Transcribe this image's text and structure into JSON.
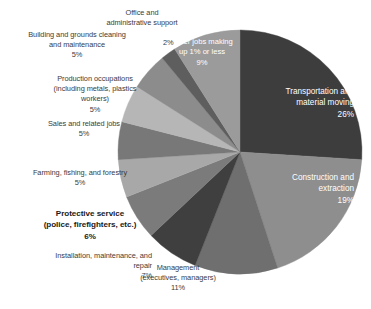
{
  "chart_data": {
    "type": "pie",
    "title": "",
    "subtitle": "",
    "xlabel": "",
    "ylabel": "",
    "legend_position": "none",
    "grid": false,
    "units": "percent",
    "start_angle_deg": 0,
    "direction": "clockwise",
    "categories": [
      "Transportation and material moving",
      "Construction and extraction",
      "Management (executives, managers)",
      "Installation, maintenance, and repair",
      "Protective service (police, firefighters, etc.)",
      "Farming, fishing, and forestry",
      "Sales and related jobs",
      "Production occupations (including metals, plastics workers)",
      "Building and grounds cleaning and maintenance",
      "Office and administrative support",
      "Other jobs making up 1% or less"
    ],
    "values": [
      26,
      19,
      11,
      7,
      6,
      5,
      5,
      5,
      5,
      2,
      9
    ],
    "colors": [
      "#3d3d3d",
      "#8e8e8e",
      "#6f6f6f",
      "#3f3f3f",
      "#7b7b7b",
      "#a8a8a8",
      "#787878",
      "#b6b6b6",
      "#8c8c8c",
      "#5e5e5e",
      "#9b9b9b"
    ]
  },
  "slices": [
    {
      "name": "transportation",
      "label": "Transportation and\nmaterial moving",
      "value_label": "26%",
      "color": "#3d3d3d",
      "inside": true
    },
    {
      "name": "construction",
      "label": "Construction and\nextraction",
      "value_label": "19%",
      "color": "#8e8e8e",
      "inside": true
    },
    {
      "name": "management",
      "label": "Management\n(executives, managers)",
      "value_label": "11%",
      "color": "#6f6f6f",
      "inside": false
    },
    {
      "name": "installation",
      "label": "Installation, maintenance, and\nrepair",
      "value_label": "7%",
      "color": "#3f3f3f",
      "inside": false
    },
    {
      "name": "protective-service",
      "label": "Protective service\n(police, firefighters, etc.)",
      "value_label": "6%",
      "color": "#7b7b7b",
      "inside": false
    },
    {
      "name": "farming",
      "label": "Farming, fishing, and forestry",
      "value_label": "5%",
      "color": "#a8a8a8",
      "inside": false
    },
    {
      "name": "sales",
      "label": "Sales and related jobs",
      "value_label": "5%",
      "color": "#787878",
      "inside": false
    },
    {
      "name": "production",
      "label": "Production occupations\n(including metals, plastics\nworkers)",
      "value_label": "5%",
      "color": "#b6b6b6",
      "inside": false
    },
    {
      "name": "building-grounds",
      "label": "Building and grounds cleaning\nand maintenance",
      "value_label": "5%",
      "color": "#8c8c8c",
      "inside": false
    },
    {
      "name": "office-admin",
      "label": "Office and\nadministrative support",
      "value_label": "2%",
      "color": "#5e5e5e",
      "inside": false
    },
    {
      "name": "other-jobs",
      "label": "Other jobs making\nup 1% or less",
      "value_label": "9%",
      "color": "#9b9b9b",
      "inside": true
    }
  ],
  "labels": {
    "office_admin_text": "Office and\nadministrative support",
    "office_admin_value": "2%",
    "building_grounds_text": "Building and grounds cleaning\nand maintenance\n5%",
    "production_text": "Production occupations\n(including metals, plastics\nworkers)\n5%",
    "sales_text": "Sales and related jobs\n5%",
    "farming_text": "Farming, fishing, and forestry\n5%",
    "protective_text": "Protective service\n(police, firefighters, etc.)\n6%",
    "installation_text": "Installation, maintenance, and\nrepair\n7%",
    "management_text": "Management\n(executives, managers)\n11%",
    "other_jobs_text": "Other jobs making\nup 1% or less\n9%",
    "transportation_text": "Transportation and\nmaterial moving\n26%",
    "construction_text": "Construction and\nextraction\n19%"
  },
  "geometry": {
    "center_x": 240,
    "center_y": 152,
    "radius": 122
  }
}
